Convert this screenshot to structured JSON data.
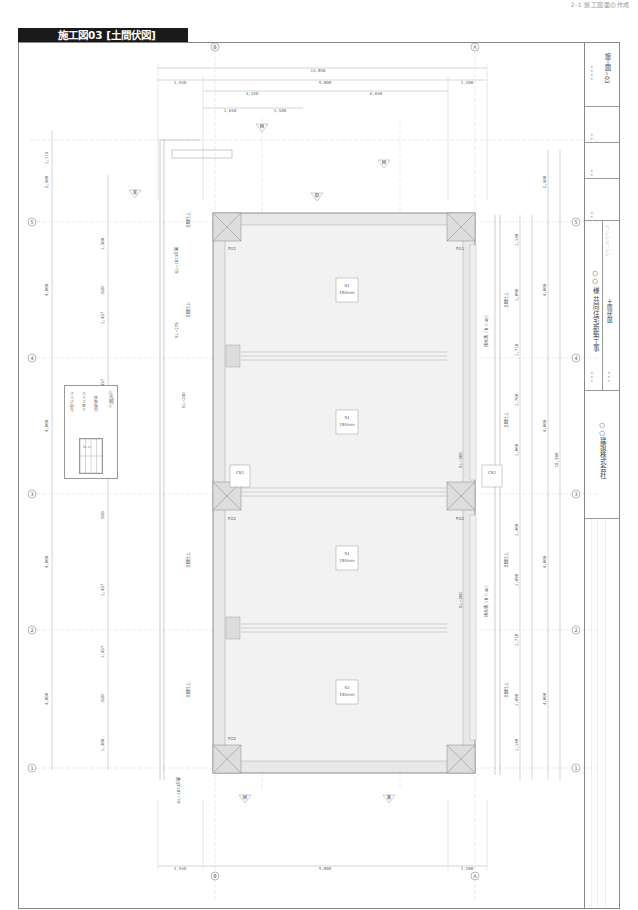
{
  "page_header": "2-1 施工図面の作成",
  "title_tab": "施工図03 [土間伏図]",
  "title_block": {
    "sheet_no": "施工図−03",
    "project": "○○ 様 共同住宅新築工事",
    "drawing_name": "土間伏図",
    "scale": "1：○○ ○：○○",
    "company": "○○建設株式会社",
    "field_marks": [
      "＊＊＊＊",
      "＊＊",
      "＊＊",
      "＊＊",
      "＊＊＊",
      "＊＊＊"
    ]
  },
  "legend": {
    "title": "＜凡例＞",
    "lines": [
      "スラブ記号",
      "スラブ厚さ",
      "鉄筋種別",
      "上端筋",
      "下端筋"
    ],
    "table": [
      [
        "S1",
        "SL−300"
      ],
      [
        "t=",
        "150mm"
      ],
      [
        "上端筋",
        "D10@200"
      ],
      [
        "下端筋",
        "D10@200"
      ]
    ]
  },
  "top_dimensions": {
    "overall": "13,850",
    "row2": [
      "1,550",
      "9,800",
      "1,500"
    ],
    "row3": [
      "3,150",
      "6,650"
    ],
    "row4": [
      "1,650",
      "1,500"
    ]
  },
  "bottom_dimensions": [
    "1,550",
    "9,800",
    "1,500"
  ],
  "left_dimensions": [
    "1,115",
    "2,500",
    "4,000",
    "4,000",
    "4,000",
    "4,000"
  ],
  "right_dimensions": [
    "2,500",
    "4,000",
    "4,000",
    "4,000",
    "4,000",
    "18,500"
  ],
  "right_sub_dimensions": [
    "1,140",
    "1,090",
    "1,710",
    "1,760",
    "1,060",
    "1,400",
    "1,090",
    "1,710",
    "1,090",
    "1,140"
  ],
  "left_sub_dimensions": [
    "1,300",
    "820",
    "1,457",
    "1,457",
    "820",
    "1,300",
    "820",
    "1,457",
    "1,457",
    "820",
    "1,300"
  ],
  "grid_rows": [
    "5",
    "4",
    "3",
    "2",
    "1"
  ],
  "grid_cols_top": [
    "B",
    "A"
  ],
  "grid_cols_bottom": [
    "B",
    "A"
  ],
  "section_marks": [
    "H",
    "E",
    "H",
    "D",
    "H",
    "B"
  ],
  "slab_tags": [
    {
      "id": "S1",
      "level": "SL−300",
      "thk": "150mm",
      "top": "D10@200",
      "bot": "D10@200"
    },
    {
      "id": "S1",
      "level": "SL−300",
      "thk": "150mm",
      "top": "D10@200",
      "bot": "D10@200"
    },
    {
      "id": "S1",
      "level": "SL−300",
      "thk": "150mm",
      "top": "D10@200",
      "bot": "D10@200"
    },
    {
      "id": "S1",
      "level": "SL−300",
      "thk": "150mm",
      "top": "D10@200",
      "bot": "D10@200"
    }
  ],
  "small_slab_tags": [
    {
      "id": "CS1",
      "level": "SL−200",
      "thk": "150mm"
    },
    {
      "id": "CS1",
      "level": "SL−200",
      "thk": "150mm"
    }
  ],
  "annotations": {
    "drainage": "排水溝（ｈ＝40）",
    "finish": "土間仕上",
    "level_marks": [
      "GL−1815天端",
      "GL−1815天端",
      "SL−300",
      "SL−300",
      "SL−275",
      "SL−250"
    ],
    "stair": "階段",
    "beam_tags": [
      "FG1",
      "FG1",
      "FG2",
      "FG2",
      "FG2"
    ],
    "labels_600": "600",
    "labels_700": "700"
  }
}
